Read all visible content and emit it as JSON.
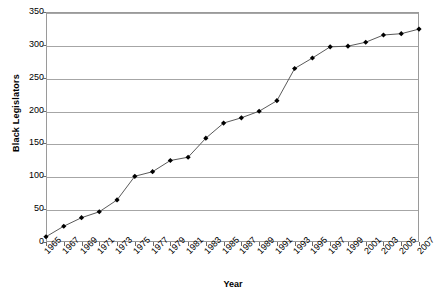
{
  "chart_data": {
    "type": "line",
    "title": "",
    "xlabel": "Year",
    "ylabel": "Black Legislators",
    "ylim": [
      0,
      350
    ],
    "ytick_values": [
      0,
      50,
      100,
      150,
      200,
      250,
      300,
      350
    ],
    "ytick_labels": [
      "0",
      "50",
      "100",
      "150",
      "200",
      "250",
      "300",
      "350"
    ],
    "grid": true,
    "legend": false,
    "marker": "diamond",
    "line_color": "#5a5a5a",
    "marker_color": "#000000",
    "categories": [
      "1965",
      "1967",
      "1969",
      "1971",
      "1973",
      "1975",
      "1977",
      "1979",
      "1981",
      "1983",
      "1985",
      "1987",
      "1989",
      "1991",
      "1993",
      "1995",
      "1997",
      "1999",
      "2001",
      "2003",
      "2005",
      "2007"
    ],
    "values": [
      8,
      24,
      37,
      46,
      64,
      100,
      107,
      124,
      129,
      158,
      181,
      189,
      199,
      215,
      264,
      280,
      297,
      298,
      304,
      315,
      317,
      324
    ],
    "series": [
      {
        "name": "Black Legislators",
        "values": [
          8,
          24,
          37,
          46,
          64,
          100,
          107,
          124,
          129,
          158,
          181,
          189,
          199,
          215,
          264,
          280,
          297,
          298,
          304,
          315,
          317,
          324
        ]
      }
    ]
  },
  "axes": {
    "y_title": "Black Legislators",
    "x_title": "Year"
  }
}
